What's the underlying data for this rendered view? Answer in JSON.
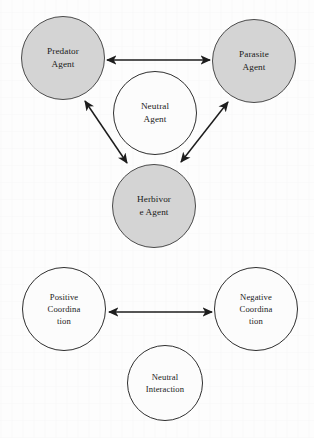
{
  "diagram": {
    "colors": {
      "shaded_fill": "#d4d4d4",
      "plain_fill": "#fcfcfc",
      "stroke": "#3a3a3a",
      "background": "#fdfdfd",
      "text": "#1a1a1a"
    },
    "groups": [
      {
        "name": "agents",
        "nodes": [
          {
            "id": "predator-agent",
            "style": "shaded",
            "lines": [
              "Predator",
              "Agent"
            ],
            "cx": 63,
            "cy": 58,
            "r": 42
          },
          {
            "id": "parasite-agent",
            "style": "shaded",
            "lines": [
              "Parasite",
              "Agent"
            ],
            "cx": 254,
            "cy": 61,
            "r": 42
          },
          {
            "id": "neutral-agent",
            "style": "plain",
            "lines": [
              "Neutral",
              "Agent"
            ],
            "cx": 155,
            "cy": 113,
            "r": 42
          },
          {
            "id": "herbivore-agent",
            "style": "shaded",
            "lines": [
              "Herbivor",
              "e Agent"
            ],
            "cx": 154,
            "cy": 206,
            "r": 42
          }
        ]
      },
      {
        "name": "coordination",
        "nodes": [
          {
            "id": "positive-coordination",
            "style": "plain",
            "lines": [
              "Positive",
              "Coordina",
              "tion"
            ],
            "cx": 64,
            "cy": 309,
            "r": 42
          },
          {
            "id": "negative-coordination",
            "style": "plain",
            "lines": [
              "Negative",
              "Coordina",
              "tion"
            ],
            "cx": 256,
            "cy": 309,
            "r": 42
          },
          {
            "id": "neutral-interaction",
            "style": "plain",
            "lines": [
              "Neutral",
              "Interaction"
            ],
            "cx": 165,
            "cy": 383,
            "r": 38
          }
        ]
      }
    ],
    "connectors": [
      {
        "id": "predator-parasite",
        "type": "double-arrow",
        "from": "predator-agent",
        "to": "parasite-agent",
        "x1": 107,
        "y1": 60,
        "x2": 210,
        "y2": 60
      },
      {
        "id": "predator-herbivore",
        "type": "double-arrow",
        "from": "herbivore-agent",
        "to": "predator-agent",
        "x1": 127,
        "y1": 163,
        "x2": 85,
        "y2": 101
      },
      {
        "id": "parasite-herbivore",
        "type": "double-arrow",
        "from": "herbivore-agent",
        "to": "parasite-agent",
        "x1": 181,
        "y1": 162,
        "x2": 228,
        "y2": 102
      },
      {
        "id": "positive-negative-coordination",
        "type": "double-arrow",
        "from": "positive-coordination",
        "to": "negative-coordination",
        "x1": 109,
        "y1": 312,
        "x2": 212,
        "y2": 312
      }
    ]
  }
}
